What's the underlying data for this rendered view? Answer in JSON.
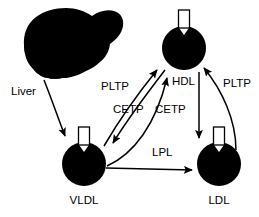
{
  "diagram": {
    "background_color": "#ffffff",
    "ink_color": "#000000",
    "nodes": [
      {
        "id": "liver",
        "label": "Liver",
        "shape": "liver-silhouette",
        "label_x": 30,
        "label_y": 92
      },
      {
        "id": "vldl",
        "label": "VLDL",
        "shape": "lipoprotein-particle",
        "cx": 84,
        "cy": 164,
        "r": 22,
        "label_x": 84,
        "label_y": 200
      },
      {
        "id": "hdl",
        "label": "HDL",
        "shape": "lipoprotein-particle",
        "cx": 184,
        "cy": 48,
        "r": 22,
        "label_x": 190,
        "label_y": 82
      },
      {
        "id": "ldl",
        "label": "LDL",
        "shape": "lipoprotein-particle",
        "cx": 219,
        "cy": 164,
        "r": 22,
        "label_x": 219,
        "label_y": 200
      }
    ],
    "edges": [
      {
        "id": "liver-to-vldl",
        "from": "liver",
        "to": "vldl",
        "label": "",
        "style": "curved-arrow"
      },
      {
        "id": "vldl-to-hdl-pltp",
        "from": "vldl",
        "to": "hdl",
        "label": "PLTP",
        "label_x": 103,
        "label_y": 87,
        "style": "curved-arrow"
      },
      {
        "id": "hdl-to-vldl-cetp",
        "from": "hdl",
        "to": "vldl",
        "label": "CETP",
        "label_x": 128,
        "label_y": 110,
        "style": "curved-arrow"
      },
      {
        "id": "vldl-to-hdl-cetp",
        "from": "vldl",
        "to": "hdl",
        "label": "CETP",
        "label_x": 170,
        "label_y": 110,
        "style": "curved-arrow"
      },
      {
        "id": "hdl-to-ldl-cetp",
        "from": "hdl",
        "to": "ldl",
        "label": "",
        "style": "straight-arrow"
      },
      {
        "id": "ldl-to-hdl-pltp",
        "from": "ldl",
        "to": "hdl",
        "label": "PLTP",
        "label_x": 225,
        "label_y": 84,
        "style": "curved-arrow"
      },
      {
        "id": "vldl-to-ldl-lpl",
        "from": "vldl",
        "to": "ldl",
        "label": "LPL",
        "label_x": 164,
        "label_y": 153,
        "style": "straight-arrow"
      }
    ],
    "labels": {
      "liver": "Liver",
      "vldl": "VLDL",
      "hdl": "HDL",
      "ldl": "LDL",
      "pltp_left": "PLTP",
      "cetp_left": "CETP",
      "cetp_right": "CETP",
      "pltp_right": "PLTP",
      "lpl": "LPL"
    }
  }
}
